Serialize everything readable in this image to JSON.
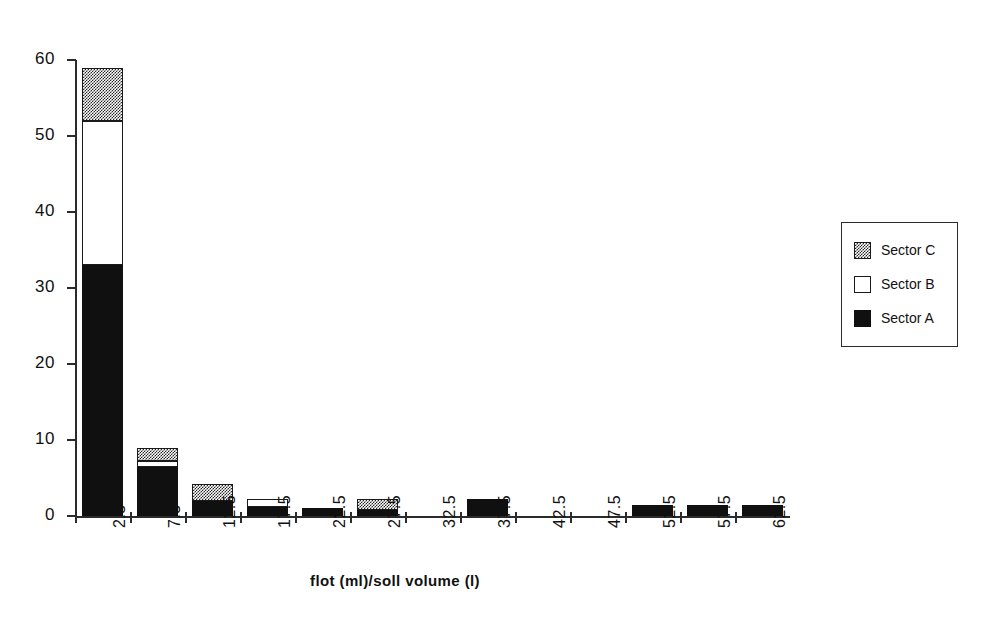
{
  "chart_data": {
    "type": "bar",
    "subtype": "stacked-bar",
    "title": "",
    "xlabel": "flot (ml)/soll volume (l)",
    "ylabel": "",
    "ylim": [
      0,
      60
    ],
    "y_ticks": [
      0,
      10,
      20,
      30,
      40,
      50,
      60
    ],
    "grid": false,
    "legend_position": "right",
    "categories": [
      "2.5",
      "7.5",
      "12.5",
      "17.5",
      "22.5",
      "27.5",
      "32.5",
      "37.5",
      "42.5",
      "47.5",
      "52.5",
      "57.5",
      "62.5"
    ],
    "series": [
      {
        "name": "Sector A",
        "fill": "solid-black",
        "values": [
          33,
          6.5,
          2,
          1.2,
          1.1,
          0.8,
          0,
          2.3,
          0,
          0,
          1.4,
          1.4,
          1.4
        ]
      },
      {
        "name": "Sector B",
        "fill": "white",
        "values": [
          19,
          0.8,
          0,
          1.0,
          0,
          0,
          0,
          0,
          0,
          0,
          0,
          0,
          0
        ]
      },
      {
        "name": "Sector C",
        "fill": "dark-dither",
        "values": [
          7,
          1.7,
          2.2,
          0,
          0,
          1.5,
          0,
          0,
          0,
          0,
          0,
          0,
          0
        ]
      }
    ],
    "totals": [
      59,
      9,
      4.2,
      2.2,
      1.1,
      2.3,
      0,
      2.3,
      0,
      0,
      1.4,
      1.4,
      1.4
    ]
  },
  "legend": {
    "items": [
      {
        "label": "Sector C",
        "swatch": "dark-dither"
      },
      {
        "label": "Sector B",
        "swatch": "white"
      },
      {
        "label": "Sector A",
        "swatch": "solid-black"
      }
    ]
  },
  "colors": {
    "ink": "#101010",
    "axis": "#2b2b2b",
    "background": "#ffffff"
  }
}
